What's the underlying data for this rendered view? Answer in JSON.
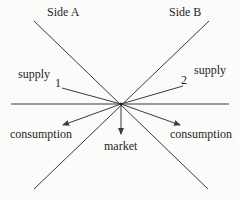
{
  "diagram": {
    "type": "flow-diagram",
    "center": {
      "x": 121,
      "y": 104
    },
    "colors": {
      "line": "#3a3a3a",
      "text": "#1e1e1e",
      "background": "#fbfbfa"
    },
    "labels": {
      "side_a": "Side A",
      "side_b": "Side B",
      "supply_left": "supply",
      "supply_right": "supply",
      "marker_1": "1",
      "marker_2": "2",
      "consumption_left": "consumption",
      "consumption_right": "consumption",
      "market": "market"
    },
    "lines": [
      {
        "name": "side-a-diagonal",
        "from": [
          34,
          21
        ],
        "to": [
          208,
          189
        ]
      },
      {
        "name": "side-b-diagonal",
        "from": [
          209,
          21
        ],
        "to": [
          34,
          189
        ]
      },
      {
        "name": "horizontal-axis",
        "from": [
          11,
          104
        ],
        "to": [
          229,
          104
        ]
      },
      {
        "name": "supply-1-line",
        "from": [
          62,
          88
        ],
        "to": [
          121,
          104
        ]
      },
      {
        "name": "supply-2-line",
        "from": [
          121,
          104
        ],
        "to": [
          183,
          86
        ]
      }
    ],
    "arrows": [
      {
        "name": "consumption-left-arrow",
        "from": [
          121,
          104
        ],
        "to": [
          63,
          125
        ]
      },
      {
        "name": "consumption-right-arrow",
        "from": [
          121,
          104
        ],
        "to": [
          180,
          125
        ]
      },
      {
        "name": "market-arrow",
        "from": [
          121,
          104
        ],
        "to": [
          121,
          134
        ]
      }
    ]
  }
}
